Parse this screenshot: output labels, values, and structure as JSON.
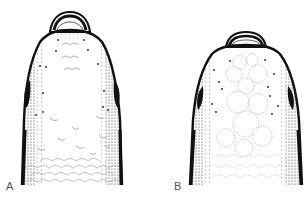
{
  "figure": {
    "panels": [
      {
        "id": "A",
        "label": "A",
        "scale_pattern": "small crescent scales anteriorly, imbricate scales posteriorly"
      },
      {
        "id": "B",
        "label": "B",
        "scale_pattern": "large rounded dotted-outline plates, imbricate scales posteriorly"
      }
    ]
  },
  "colors": {
    "ink": "#111111",
    "stipple": "#333333",
    "scale_line": "#9a9a9a",
    "background": "#ffffff",
    "label": "#555555"
  }
}
